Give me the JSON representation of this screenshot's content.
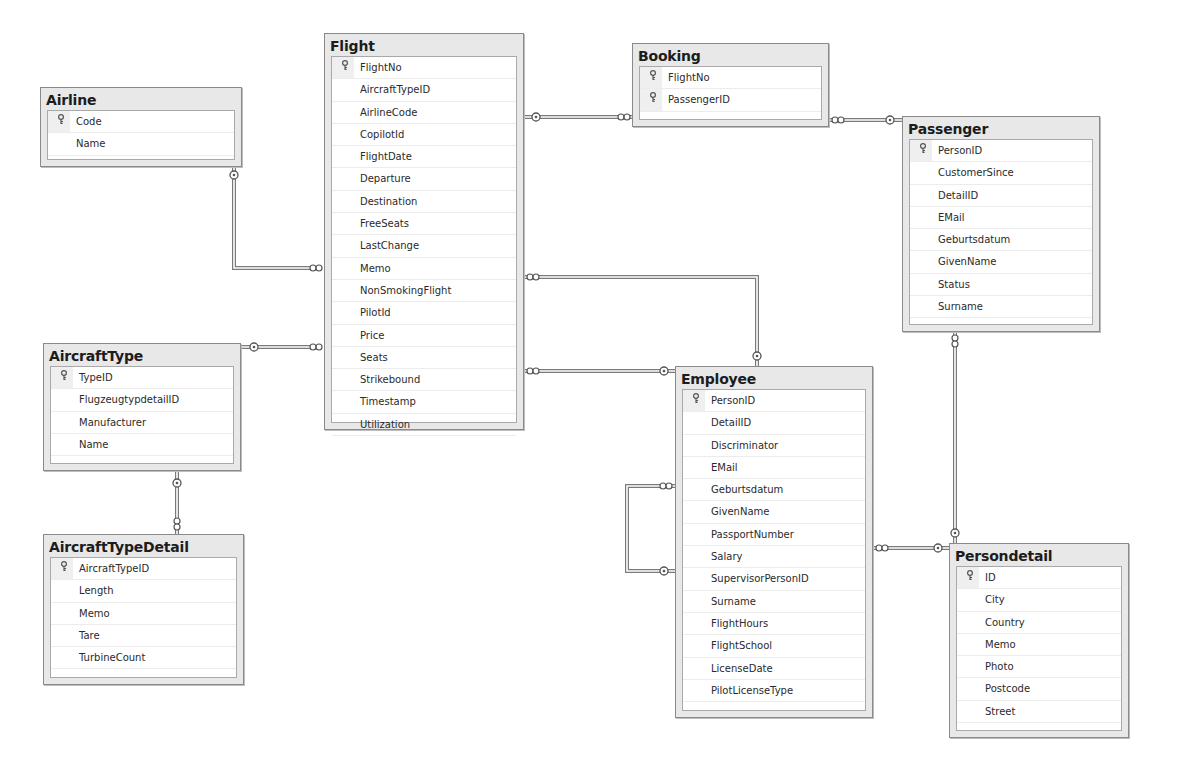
{
  "diagram": {
    "type": "entity-relationship",
    "entities": [
      {
        "name": "Airline",
        "x": 40,
        "y": 87,
        "w": 202,
        "h": 80,
        "columns": [
          {
            "name": "Code",
            "pk": true
          },
          {
            "name": "Name",
            "pk": false
          }
        ]
      },
      {
        "name": "Flight",
        "x": 324,
        "y": 33,
        "w": 200,
        "h": 397,
        "columns": [
          {
            "name": "FlightNo",
            "pk": true
          },
          {
            "name": "AircraftTypeID",
            "pk": false
          },
          {
            "name": "AirlineCode",
            "pk": false
          },
          {
            "name": "CopilotId",
            "pk": false
          },
          {
            "name": "FlightDate",
            "pk": false
          },
          {
            "name": "Departure",
            "pk": false
          },
          {
            "name": "Destination",
            "pk": false
          },
          {
            "name": "FreeSeats",
            "pk": false
          },
          {
            "name": "LastChange",
            "pk": false
          },
          {
            "name": "Memo",
            "pk": false
          },
          {
            "name": "NonSmokingFlight",
            "pk": false
          },
          {
            "name": "PilotId",
            "pk": false
          },
          {
            "name": "Price",
            "pk": false
          },
          {
            "name": "Seats",
            "pk": false
          },
          {
            "name": "Strikebound",
            "pk": false
          },
          {
            "name": "Timestamp",
            "pk": false
          },
          {
            "name": "Utilization",
            "pk": false
          }
        ]
      },
      {
        "name": "Booking",
        "x": 632,
        "y": 43,
        "w": 197,
        "h": 84,
        "columns": [
          {
            "name": "FlightNo",
            "pk": true
          },
          {
            "name": "PassengerID",
            "pk": true
          }
        ]
      },
      {
        "name": "Passenger",
        "x": 902,
        "y": 116,
        "w": 198,
        "h": 216,
        "columns": [
          {
            "name": "PersonID",
            "pk": true
          },
          {
            "name": "CustomerSince",
            "pk": false
          },
          {
            "name": "DetailID",
            "pk": false
          },
          {
            "name": "EMail",
            "pk": false
          },
          {
            "name": "Geburtsdatum",
            "pk": false
          },
          {
            "name": "GivenName",
            "pk": false
          },
          {
            "name": "Status",
            "pk": false
          },
          {
            "name": "Surname",
            "pk": false
          }
        ]
      },
      {
        "name": "AircraftType",
        "x": 43,
        "y": 343,
        "w": 198,
        "h": 128,
        "columns": [
          {
            "name": "TypeID",
            "pk": true
          },
          {
            "name": "FlugzeugtypdetailID",
            "pk": false
          },
          {
            "name": "Manufacturer",
            "pk": false
          },
          {
            "name": "Name",
            "pk": false
          }
        ]
      },
      {
        "name": "AircraftTypeDetail",
        "x": 43,
        "y": 534,
        "w": 201,
        "h": 151,
        "columns": [
          {
            "name": "AircraftTypeID",
            "pk": true
          },
          {
            "name": "Length",
            "pk": false
          },
          {
            "name": "Memo",
            "pk": false
          },
          {
            "name": "Tare",
            "pk": false
          },
          {
            "name": "TurbineCount",
            "pk": false
          }
        ]
      },
      {
        "name": "Employee",
        "x": 675,
        "y": 366,
        "w": 198,
        "h": 352,
        "columns": [
          {
            "name": "PersonID",
            "pk": true
          },
          {
            "name": "DetailID",
            "pk": false
          },
          {
            "name": "Discriminator",
            "pk": false
          },
          {
            "name": "EMail",
            "pk": false
          },
          {
            "name": "Geburtsdatum",
            "pk": false
          },
          {
            "name": "GivenName",
            "pk": false
          },
          {
            "name": "PassportNumber",
            "pk": false
          },
          {
            "name": "Salary",
            "pk": false
          },
          {
            "name": "SupervisorPersonID",
            "pk": false
          },
          {
            "name": "Surname",
            "pk": false
          },
          {
            "name": "FlightHours",
            "pk": false
          },
          {
            "name": "FlightSchool",
            "pk": false
          },
          {
            "name": "LicenseDate",
            "pk": false
          },
          {
            "name": "PilotLicenseType",
            "pk": false
          }
        ]
      },
      {
        "name": "Persondetail",
        "x": 949,
        "y": 543,
        "w": 180,
        "h": 195,
        "columns": [
          {
            "name": "ID",
            "pk": true
          },
          {
            "name": "City",
            "pk": false
          },
          {
            "name": "Country",
            "pk": false
          },
          {
            "name": "Memo",
            "pk": false
          },
          {
            "name": "Photo",
            "pk": false
          },
          {
            "name": "Postcode",
            "pk": false
          },
          {
            "name": "Street",
            "pk": false
          }
        ]
      }
    ],
    "relationships": [
      {
        "from": "Airline",
        "to": "Flight",
        "one_end": "Airline",
        "many_end": "Flight",
        "path": [
          [
            234,
            167
          ],
          [
            234,
            268
          ],
          [
            322,
            268
          ]
        ],
        "one_marker": [
          234,
          175
        ],
        "many_marker": [
          316,
          268
        ]
      },
      {
        "from": "AircraftType",
        "to": "Flight",
        "one_end": "AircraftType",
        "many_end": "Flight",
        "path": [
          [
            241,
            347
          ],
          [
            322,
            347
          ]
        ],
        "one_marker": [
          254,
          347
        ],
        "many_marker": [
          316,
          347
        ]
      },
      {
        "from": "AircraftType",
        "to": "AircraftTypeDetail",
        "one_end": "AircraftType",
        "many_end": "AircraftTypeDetail",
        "path": [
          [
            177,
            471
          ],
          [
            177,
            534
          ]
        ],
        "one_marker": [
          177,
          483
        ],
        "many_marker": [
          177,
          524
        ]
      },
      {
        "from": "Flight",
        "to": "Booking",
        "one_end": "Flight",
        "many_end": "Booking",
        "path": [
          [
            524,
            117
          ],
          [
            632,
            117
          ]
        ],
        "one_marker": [
          536,
          117
        ],
        "many_marker": [
          624,
          117
        ]
      },
      {
        "from": "Booking",
        "to": "Passenger",
        "one_end": "Passenger",
        "many_end": "Booking",
        "path": [
          [
            829,
            120
          ],
          [
            902,
            120
          ]
        ],
        "one_marker": [
          890,
          120
        ],
        "many_marker": [
          838,
          120
        ]
      },
      {
        "from": "Flight",
        "to": "Employee (Pilot)",
        "one_end": "Employee",
        "many_end": "Flight",
        "path": [
          [
            524,
            277
          ],
          [
            757,
            277
          ],
          [
            757,
            366
          ]
        ],
        "one_marker": [
          757,
          356
        ],
        "many_marker": [
          533,
          277
        ]
      },
      {
        "from": "Flight",
        "to": "Employee (Copilot)",
        "one_end": "Employee",
        "many_end": "Flight",
        "path": [
          [
            524,
            371
          ],
          [
            675,
            371
          ]
        ],
        "one_marker": [
          664,
          371
        ],
        "many_marker": [
          533,
          371
        ]
      },
      {
        "from": "Employee",
        "to": "Employee (Supervisor)",
        "one_end": "Employee",
        "many_end": "Employee",
        "path": [
          [
            675,
            486
          ],
          [
            627,
            486
          ],
          [
            627,
            571
          ],
          [
            675,
            571
          ]
        ],
        "one_marker": [
          664,
          571
        ],
        "many_marker": [
          666,
          486
        ]
      },
      {
        "from": "Employee",
        "to": "Persondetail",
        "one_end": "Persondetail",
        "many_end": "Employee",
        "path": [
          [
            873,
            548
          ],
          [
            949,
            548
          ]
        ],
        "one_marker": [
          938,
          548
        ],
        "many_marker": [
          882,
          548
        ]
      },
      {
        "from": "Passenger",
        "to": "Persondetail",
        "one_end": "Persondetail",
        "many_end": "Passenger",
        "path": [
          [
            955,
            332
          ],
          [
            955,
            543
          ]
        ],
        "one_marker": [
          955,
          533
        ],
        "many_marker": [
          955,
          341
        ]
      }
    ],
    "icons": {
      "primary_key": "key-icon"
    },
    "colors": {
      "header_bg": "#e8e8e8",
      "border": "#8a8a8a",
      "line": "#7a7a7a",
      "body_bg": "#ffffff"
    }
  }
}
